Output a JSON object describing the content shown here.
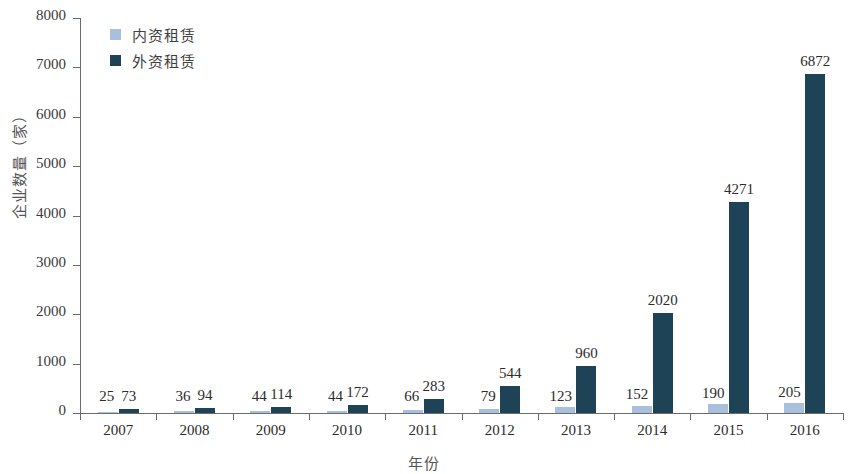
{
  "chart_data": {
    "type": "bar",
    "title": "",
    "xlabel": "年份",
    "ylabel": "企业数量（家）",
    "categories": [
      "2007",
      "2008",
      "2009",
      "2010",
      "2011",
      "2012",
      "2013",
      "2014",
      "2015",
      "2016"
    ],
    "series": [
      {
        "name": "内资租赁",
        "color": "#a8c0dc",
        "values": [
          25,
          36,
          44,
          44,
          66,
          79,
          123,
          152,
          190,
          205
        ],
        "labels": [
          "25",
          "36",
          "44",
          "44",
          "66",
          "79",
          "123",
          "152",
          "190",
          "205"
        ]
      },
      {
        "name": "外资租赁",
        "color": "#1e4256",
        "values": [
          73,
          94,
          114,
          172,
          283,
          544,
          960,
          2020,
          4271,
          6872
        ],
        "labels": [
          "73",
          "94",
          "114",
          "172",
          "283",
          "544",
          "960",
          "2020",
          "4271",
          "6872"
        ]
      }
    ],
    "ylim": [
      0,
      8000
    ],
    "yticks": [
      0,
      1000,
      2000,
      3000,
      4000,
      5000,
      6000,
      7000,
      8000
    ],
    "ytick_labels": [
      "0",
      "1000",
      "2000",
      "3000",
      "4000",
      "5000",
      "6000",
      "7000",
      "8000"
    ],
    "grid": false,
    "legend_position": "top-left",
    "data_labels": true
  },
  "legend": {
    "items": [
      {
        "label": "内资租赁",
        "color": "#a8c0dc"
      },
      {
        "label": "外资租赁",
        "color": "#1e4256"
      }
    ]
  },
  "axes": {
    "y_title": "企业数量（家）",
    "x_title": "年份"
  }
}
